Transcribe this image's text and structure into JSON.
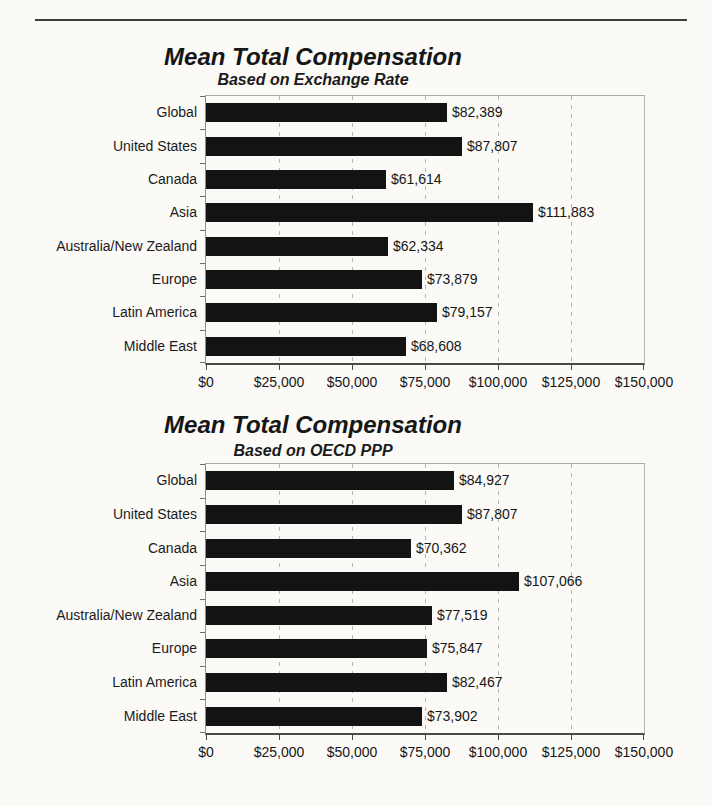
{
  "chart_data": [
    {
      "type": "bar",
      "orientation": "horizontal",
      "title": "Mean Total Compensation",
      "subtitle": "Based on Exchange Rate",
      "categories": [
        "Global",
        "United States",
        "Canada",
        "Asia",
        "Australia/New Zealand",
        "Europe",
        "Latin America",
        "Middle East"
      ],
      "values": [
        82389,
        87807,
        61614,
        111883,
        62334,
        73879,
        79157,
        68608
      ],
      "value_labels": [
        "$82,389",
        "$87,807",
        "$61,614",
        "$111,883",
        "$62,334",
        "$73,879",
        "$79,157",
        "$68,608"
      ],
      "xlabel": "",
      "ylabel": "",
      "xlim": [
        0,
        150000
      ],
      "x_tick_labels": [
        "$0",
        "$25,000",
        "$50,000",
        "$75,000",
        "$100,000",
        "$125,000",
        "$150,000"
      ],
      "grid": "vertical-dashed",
      "legend": "none",
      "bar_color": "#131313"
    },
    {
      "type": "bar",
      "orientation": "horizontal",
      "title": "Mean Total Compensation",
      "subtitle": "Based on OECD PPP",
      "categories": [
        "Global",
        "United States",
        "Canada",
        "Asia",
        "Australia/New Zealand",
        "Europe",
        "Latin America",
        "Middle East"
      ],
      "values": [
        84927,
        87807,
        70362,
        107066,
        77519,
        75847,
        82467,
        73902
      ],
      "value_labels": [
        "$84,927",
        "$87,807",
        "$70,362",
        "$107,066",
        "$77,519",
        "$75,847",
        "$82,467",
        "$73,902"
      ],
      "xlabel": "",
      "ylabel": "",
      "xlim": [
        0,
        150000
      ],
      "x_tick_labels": [
        "$0",
        "$25,000",
        "$50,000",
        "$75,000",
        "$100,000",
        "$125,000",
        "$150,000"
      ],
      "grid": "vertical-dashed",
      "legend": "none",
      "bar_color": "#131313"
    }
  ]
}
